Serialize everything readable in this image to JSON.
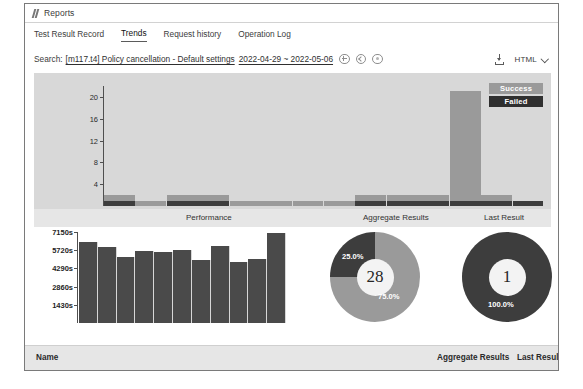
{
  "window": {
    "title": "Reports",
    "title_icon": "script-icon"
  },
  "tabs": [
    {
      "label": "Test Result Record",
      "active": false
    },
    {
      "label": "Trends",
      "active": true
    },
    {
      "label": "Request history",
      "active": false
    },
    {
      "label": "Operation Log",
      "active": false
    }
  ],
  "search": {
    "label": "Search:",
    "query": "[m117.t4] Policy cancellation - Default settings",
    "date_range": "2022-04-29 ~ 2022-05-06",
    "icons": [
      "add-circle-icon",
      "back-circle-icon",
      "clear-circle-icon"
    ]
  },
  "toolbar": {
    "download_icon": "download-icon",
    "export_format": "HTML",
    "chevron": "chevron-down-icon"
  },
  "columns": {
    "performance": "Performance",
    "aggregate": "Aggregate Results",
    "last": "Last Result"
  },
  "footer": {
    "name": "Name",
    "aggregate": "Aggregate Results",
    "last": "Last Result"
  },
  "colors": {
    "success": "#9a9a9a",
    "failed": "#3d3d3d",
    "duration_bar": "#4a4a4a",
    "panel_bg": "#d8d8d8",
    "header_bg": "#e6e6e6"
  },
  "chart_data": [
    {
      "type": "bar",
      "title": "Trends",
      "stacked": true,
      "xlabel": "",
      "ylabel": "",
      "ylim": [
        0,
        22
      ],
      "yticks": [
        4,
        8,
        12,
        16,
        20
      ],
      "grid": false,
      "legend": [
        "Success",
        "Failed"
      ],
      "legend_position": "top-right",
      "categories": [
        "1",
        "2",
        "3",
        "4",
        "5",
        "6",
        "7",
        "8",
        "9",
        "10",
        "11",
        "12",
        "13",
        "14"
      ],
      "series": [
        {
          "name": "Success",
          "values": [
            1,
            1,
            1,
            1,
            1,
            1,
            1,
            1,
            1,
            1,
            1,
            20,
            1,
            0
          ]
        },
        {
          "name": "Failed",
          "values": [
            1,
            0,
            1,
            1,
            0,
            0,
            0,
            0,
            1,
            1,
            1,
            1,
            1,
            1
          ]
        }
      ]
    },
    {
      "type": "bar",
      "title": "Duration",
      "xlabel": "",
      "ylabel": "seconds",
      "ylim": [
        0,
        7150
      ],
      "yticks": [
        "1430s",
        "2860s",
        "4290s",
        "5720s",
        "7150s"
      ],
      "grid": false,
      "categories": [
        "1",
        "2",
        "3",
        "4",
        "5",
        "6",
        "7",
        "8",
        "9",
        "10",
        "11"
      ],
      "values": [
        6400,
        6000,
        5200,
        5650,
        5600,
        5750,
        4950,
        6050,
        4800,
        5050,
        7050
      ]
    },
    {
      "type": "pie",
      "title": "Aggregate Results",
      "center_value": "28",
      "labels": [
        "Failed",
        "Success"
      ],
      "values": [
        25.0,
        75.0
      ],
      "value_labels": [
        "25.0%",
        "75.0%"
      ],
      "donut": true
    },
    {
      "type": "pie",
      "title": "Last Result",
      "center_value": "1",
      "labels": [
        "Failed"
      ],
      "values": [
        100.0
      ],
      "value_labels": [
        "100.0%"
      ],
      "donut": true
    }
  ]
}
